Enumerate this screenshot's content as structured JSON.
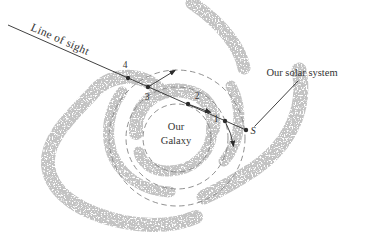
{
  "diagram": {
    "labels": {
      "line_of_sight": "Line of sight",
      "solar_system": "Our solar system",
      "galaxy_line1": "Our",
      "galaxy_line2": "Galaxy"
    },
    "points": {
      "p1": "1",
      "p2": "2",
      "p3": "3",
      "p4": "4",
      "sun": "S"
    },
    "colors": {
      "arm": "#c3c3c3",
      "orbit": "#858585",
      "ink": "#2b2b2b",
      "text": "#343434",
      "background": "#ffffff"
    }
  }
}
